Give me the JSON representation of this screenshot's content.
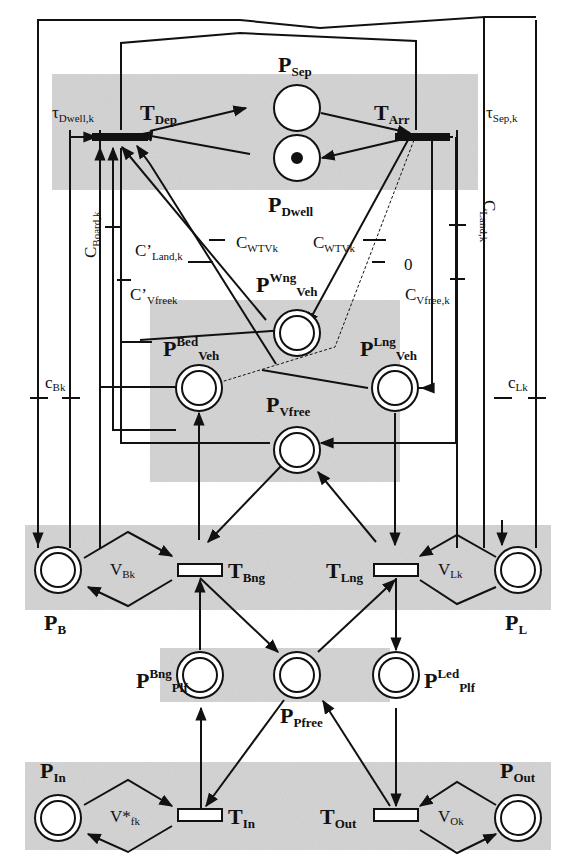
{
  "figure": {
    "type": "Petri net diagram",
    "colors": {
      "shade": "#d4d4d4",
      "line": "#111111",
      "background": "#ffffff"
    }
  },
  "places": {
    "sep": {
      "main": "P",
      "sub": "Sep"
    },
    "dwell": {
      "main": "P",
      "sub": "Dwell"
    },
    "wng_veh": {
      "main": "P",
      "sup": "Wng",
      "sub": "Veh"
    },
    "bed_veh": {
      "main": "P",
      "sup": "Bed",
      "sub": "Veh"
    },
    "lng_veh": {
      "main": "P",
      "sup": "Lng",
      "sub": "Veh"
    },
    "vfree": {
      "main": "P",
      "sub": "Vfree"
    },
    "b": {
      "main": "P",
      "sub": "B"
    },
    "l": {
      "main": "P",
      "sub": "L"
    },
    "bng_plf": {
      "main": "P",
      "sup": "Bng",
      "sub": "Plf"
    },
    "pfree": {
      "main": "P",
      "sub": "Pfree"
    },
    "led_plf": {
      "main": "P",
      "sup": "Led",
      "sub": "Plf"
    },
    "in": {
      "main": "P",
      "sub": "In"
    },
    "out": {
      "main": "P",
      "sub": "Out"
    }
  },
  "transitions": {
    "dep": {
      "main": "T",
      "sub": "Dep"
    },
    "arr": {
      "main": "T",
      "sub": "Arr"
    },
    "bng": {
      "main": "T",
      "sub": "Bng"
    },
    "lng": {
      "main": "T",
      "sub": "Lng"
    },
    "in": {
      "main": "T",
      "sub": "In"
    },
    "out": {
      "main": "T",
      "sub": "Out"
    }
  },
  "annotations": {
    "tau_dwell": {
      "main": "τ",
      "sub": "Dwell,k"
    },
    "tau_sep": {
      "main": "τ",
      "sub": "Sep,k"
    },
    "c_board": {
      "main": "C",
      "sub": "Board,k"
    },
    "c_land": {
      "main": "C",
      "sub": "Land,k"
    },
    "c_land_prime": {
      "main": "C’",
      "sub": "Land,k"
    },
    "c_wtv_left": {
      "main": "C",
      "sub": "WTVk"
    },
    "c_wtv_right": {
      "main": "C",
      "sub": "WTVk"
    },
    "zero": {
      "main": "0"
    },
    "c_vfree_prime": {
      "main": "C’",
      "sub": "Vfreek"
    },
    "c_vfree": {
      "main": "C",
      "sub": "Vfree,k"
    },
    "c_bk": {
      "main": "c",
      "sub": "Bk"
    },
    "c_lk": {
      "main": "c",
      "sub": "Lk"
    },
    "v_bk": {
      "main": "V",
      "sub": "Bk"
    },
    "v_lk": {
      "main": "V",
      "sub": "Lk"
    },
    "v_fk": {
      "main": "V*",
      "sub": "fk"
    },
    "v_ok": {
      "main": "V",
      "sub": "Ok"
    }
  },
  "tokens": {
    "dwell": 1
  }
}
